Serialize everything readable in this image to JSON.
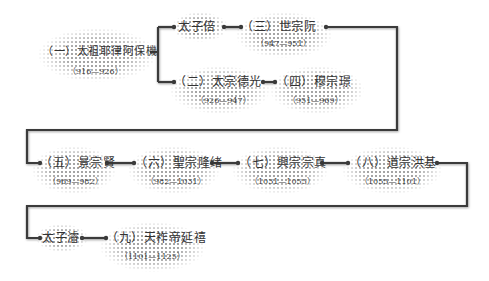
{
  "diagram": {
    "type": "lineage-flowchart",
    "line_color": "#3a3a3a",
    "nodes": [
      {
        "id": "n1",
        "name": "（一）太祖耶律阿保機",
        "dates": "（916—926）"
      },
      {
        "id": "bei",
        "name": "太子倍",
        "dates": ""
      },
      {
        "id": "n3",
        "name": "（三）世宗阮",
        "dates": "（947—951）"
      },
      {
        "id": "n2",
        "name": "（二）太宗德光",
        "dates": "（926—947）"
      },
      {
        "id": "n4",
        "name": "（四）穆宗璟",
        "dates": "（951—969）"
      },
      {
        "id": "n5",
        "name": "（五）景宗賢",
        "dates": "（969—982）"
      },
      {
        "id": "n6",
        "name": "（六）聖宗隆绪",
        "dates": "（982—1031）"
      },
      {
        "id": "n7",
        "name": "（七）興宗宗真",
        "dates": "（1031—1055）"
      },
      {
        "id": "n8",
        "name": "（八）道宗洪基",
        "dates": "（1055—1101）"
      },
      {
        "id": "jun",
        "name": "太子濬",
        "dates": ""
      },
      {
        "id": "n9",
        "name": "（九）天祚帝延禧",
        "dates": "（1101—1125）"
      }
    ],
    "edges": [
      [
        "n1",
        "bei"
      ],
      [
        "n1",
        "n2"
      ],
      [
        "bei",
        "n3"
      ],
      [
        "n2",
        "n4"
      ],
      [
        "n3",
        "n5"
      ],
      [
        "n5",
        "n6"
      ],
      [
        "n6",
        "n7"
      ],
      [
        "n7",
        "n8"
      ],
      [
        "n8",
        "jun"
      ],
      [
        "jun",
        "n9"
      ]
    ]
  }
}
